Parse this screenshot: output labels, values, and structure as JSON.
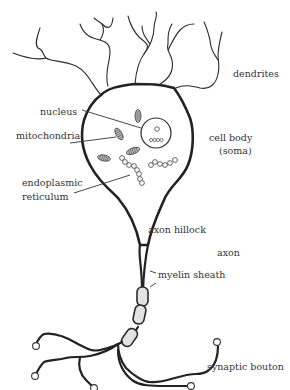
{
  "diagram": {
    "labels": {
      "dendrites": "dendrites",
      "nucleus": "nucleus",
      "mitochondria": "mitochondria",
      "cell_body_line1": "cell body",
      "cell_body_line2": "(soma)",
      "er_line1": "endoplasmic",
      "er_line2": "reticulum",
      "axon_hillock": "axon hillock",
      "axon": "axon",
      "myelin_sheath": "myelin sheath",
      "synaptic_bouton": "synaptic bouton"
    },
    "colors": {
      "line": "#222222",
      "myelin_fill": "#e3e3e3",
      "mito_fill": "#bdbdbd",
      "text": "#333333",
      "background": "#ffffff"
    }
  }
}
